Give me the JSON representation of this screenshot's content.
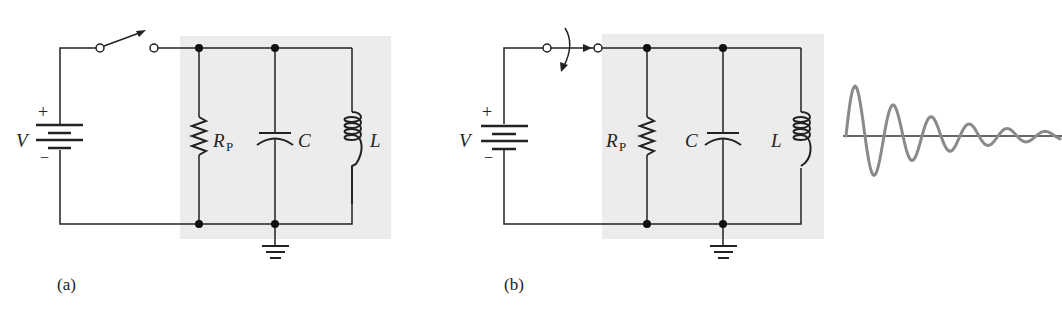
{
  "figure": {
    "panels": [
      {
        "id": "a",
        "caption": "(a)",
        "switch_state": "open",
        "labels": {
          "source": "V",
          "plus": "+",
          "minus": "−",
          "resistor": "R",
          "resistor_sub": "P",
          "capacitor": "C",
          "inductor": "L"
        }
      },
      {
        "id": "b",
        "caption": "(b)",
        "switch_state": "closing",
        "labels": {
          "source": "V",
          "plus": "+",
          "minus": "−",
          "resistor": "R",
          "resistor_sub": "P",
          "capacitor": "C",
          "inductor": "L"
        }
      }
    ],
    "waveform": {
      "description": "damped oscillation",
      "color": "#8a8a8a",
      "peaks_visible": 7
    },
    "colors": {
      "tank_shading": "#ececec",
      "wire": "#222222",
      "waveform": "#8a8a8a"
    }
  }
}
